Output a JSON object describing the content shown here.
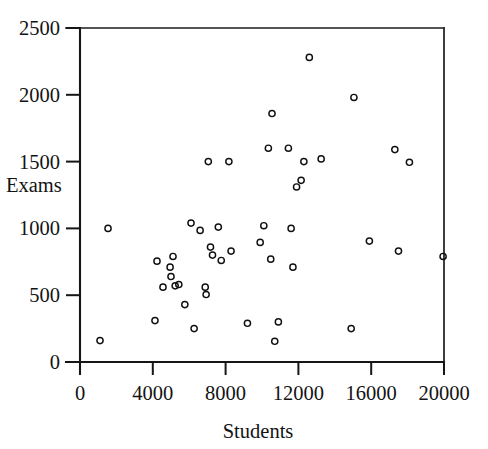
{
  "chart_data": {
    "type": "scatter",
    "title": "",
    "xlabel": "Students",
    "ylabel": "Exams",
    "xlim": [
      0,
      20000
    ],
    "ylim": [
      0,
      2500
    ],
    "xticks": [
      0,
      4000,
      8000,
      12000,
      16000,
      20000
    ],
    "yticks": [
      0,
      500,
      1000,
      1500,
      2000,
      2500
    ],
    "xtick_labels": [
      "0",
      "4000",
      "8000",
      "12000",
      "16000",
      "20000"
    ],
    "ytick_labels": [
      "0",
      "500",
      "1000",
      "1500",
      "2000",
      "2500"
    ],
    "grid": false,
    "legend": null,
    "marker": "open-circle",
    "marker_color": "#101010",
    "n_points": 46,
    "points": [
      {
        "x": 1100,
        "y": 160
      },
      {
        "x": 1540,
        "y": 1000
      },
      {
        "x": 4120,
        "y": 310
      },
      {
        "x": 4230,
        "y": 755
      },
      {
        "x": 4560,
        "y": 560
      },
      {
        "x": 4950,
        "y": 710
      },
      {
        "x": 5000,
        "y": 640
      },
      {
        "x": 5110,
        "y": 790
      },
      {
        "x": 5230,
        "y": 570
      },
      {
        "x": 5430,
        "y": 580
      },
      {
        "x": 5760,
        "y": 430
      },
      {
        "x": 6100,
        "y": 1040
      },
      {
        "x": 6270,
        "y": 250
      },
      {
        "x": 6600,
        "y": 985
      },
      {
        "x": 6880,
        "y": 560
      },
      {
        "x": 6930,
        "y": 505
      },
      {
        "x": 7050,
        "y": 1500
      },
      {
        "x": 7170,
        "y": 860
      },
      {
        "x": 7280,
        "y": 800
      },
      {
        "x": 7760,
        "y": 760
      },
      {
        "x": 8180,
        "y": 1500
      },
      {
        "x": 8300,
        "y": 830
      },
      {
        "x": 9200,
        "y": 290
      },
      {
        "x": 9900,
        "y": 895
      },
      {
        "x": 10100,
        "y": 1020
      },
      {
        "x": 10350,
        "y": 1600
      },
      {
        "x": 10480,
        "y": 770
      },
      {
        "x": 10550,
        "y": 1860
      },
      {
        "x": 10700,
        "y": 155
      },
      {
        "x": 10900,
        "y": 300
      },
      {
        "x": 11450,
        "y": 1600
      },
      {
        "x": 11600,
        "y": 1000
      },
      {
        "x": 11700,
        "y": 710
      },
      {
        "x": 11900,
        "y": 1310
      },
      {
        "x": 12150,
        "y": 1360
      },
      {
        "x": 12300,
        "y": 1500
      },
      {
        "x": 12600,
        "y": 2280
      },
      {
        "x": 13250,
        "y": 1520
      },
      {
        "x": 14900,
        "y": 250
      },
      {
        "x": 15050,
        "y": 1980
      },
      {
        "x": 15900,
        "y": 905
      },
      {
        "x": 17300,
        "y": 1590
      },
      {
        "x": 17500,
        "y": 830
      },
      {
        "x": 18100,
        "y": 1495
      },
      {
        "x": 19950,
        "y": 790
      },
      {
        "x": 7600,
        "y": 1010
      }
    ]
  },
  "axes": {
    "y_title": "Exams",
    "x_title": "Students"
  }
}
